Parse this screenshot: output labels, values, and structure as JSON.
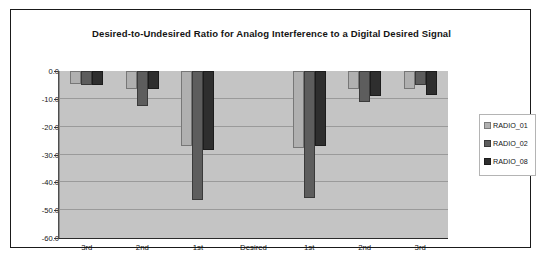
{
  "chart_data": {
    "type": "bar",
    "title": "Desired-to-Undesired Ratio for Analog Interference to a Digital Desired Signal",
    "xlabel": "",
    "ylabel": "",
    "categories": [
      "3rd",
      "2nd",
      "1st",
      "Desired",
      "1st",
      "2nd",
      "3rd"
    ],
    "series": [
      {
        "name": "RADIO_01",
        "color": "#b0b0b0",
        "values": [
          -55.5,
          -53.5,
          -33.0,
          null,
          -32.5,
          -53.5,
          -53.5
        ]
      },
      {
        "name": "RADIO_02",
        "color": "#5d5d5d",
        "values": [
          -55.0,
          -47.5,
          -13.5,
          null,
          -14.5,
          -49.0,
          -55.0
        ]
      },
      {
        "name": "RADIO_08",
        "color": "#2e2e2e",
        "values": [
          -55.0,
          -53.5,
          -31.5,
          null,
          -33.0,
          -51.0,
          -51.5
        ]
      }
    ],
    "ylim": [
      -60.0,
      0.0
    ],
    "ytick_labels": [
      "0.0",
      "-10.0",
      "-20.0",
      "-30.0",
      "-40.0",
      "-50.0",
      "-60.0"
    ],
    "ytick_values": [
      0.0,
      -10.0,
      -20.0,
      -30.0,
      -40.0,
      -50.0,
      -60.0
    ],
    "grid": true,
    "legend_position": "right",
    "plot_background": "#c4c4c4",
    "frame_color": "#1a1a1a"
  },
  "legend": {
    "items": [
      {
        "label": "RADIO_01"
      },
      {
        "label": "RADIO_02"
      },
      {
        "label": "RADIO_08"
      }
    ]
  }
}
